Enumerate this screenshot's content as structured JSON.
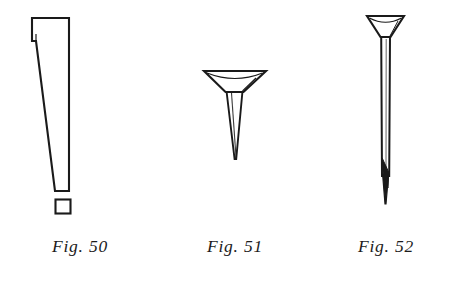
{
  "plate": {
    "background_color": "#ffffff",
    "ink_color": "#1a1a1a",
    "medium": "scanned line engraving",
    "figure_count": 3
  },
  "figures": [
    {
      "id": "fig-50",
      "caption": "Fig. 50",
      "subject": "cut nail with offset flat head and tapered rectangular shank, shown with detached square cross-section below the point",
      "orientation": "vertical",
      "style": "outline line drawing, unshaded",
      "parts": [
        "offset-flat-head",
        "tapered-shank",
        "blunt-flat-point",
        "square-cross-section"
      ]
    },
    {
      "id": "fig-51",
      "caption": "Fig. 51",
      "subject": "short tack with wide countersunk conical head and sharply tapered point",
      "orientation": "vertical",
      "style": "outline line drawing with light facet shading",
      "parts": [
        "countersunk-conical-head",
        "tapered-shank",
        "sharp-point"
      ]
    },
    {
      "id": "fig-52",
      "caption": "Fig. 52",
      "subject": "long slender finishing nail with countersunk flared head, straight shank and shaded wedge point",
      "orientation": "vertical",
      "style": "outline line drawing with solid shaded point",
      "parts": [
        "countersunk-flared-head",
        "straight-shank",
        "shaded-wedge-point"
      ]
    }
  ]
}
